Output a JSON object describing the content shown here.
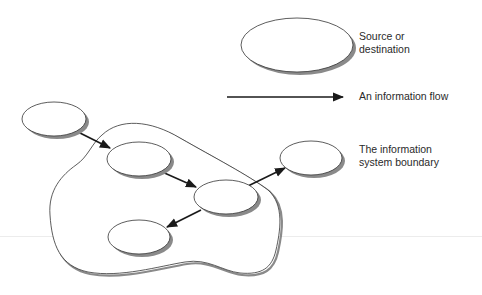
{
  "diagram": {
    "legend": {
      "source": {
        "line1": "Source or",
        "line2": "destination"
      },
      "flow": {
        "label": "An information flow"
      },
      "boundary": {
        "line1": "The information",
        "line2": "system boundary"
      }
    },
    "nodes": [
      {
        "id": "A",
        "label": "",
        "position": "outside-top-left"
      },
      {
        "id": "B",
        "label": "",
        "position": "inside-upper"
      },
      {
        "id": "C",
        "label": "",
        "position": "inside-center"
      },
      {
        "id": "D",
        "label": "",
        "position": "outside-right"
      },
      {
        "id": "E",
        "label": "",
        "position": "inside-lower"
      }
    ],
    "edges": [
      {
        "from": "A",
        "to": "B"
      },
      {
        "from": "B",
        "to": "C"
      },
      {
        "from": "C",
        "to": "D"
      },
      {
        "from": "C",
        "to": "E"
      }
    ],
    "colors": {
      "stroke": "#333333",
      "arrow": "#1a1a1a",
      "shadow": "#9a9a9a",
      "fill": "#ffffff"
    }
  }
}
